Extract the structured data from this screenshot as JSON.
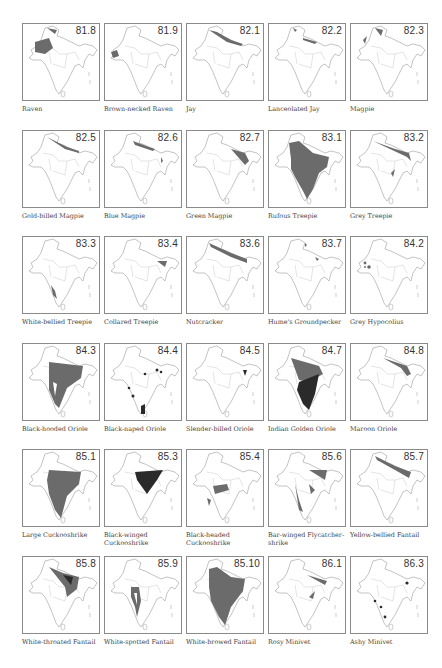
{
  "figure": {
    "shade_color": "#6b6b6b",
    "dark_shade_color": "#2a2a2a",
    "border_color": "#8a8a8a",
    "panels": [
      {
        "code": "81.8",
        "name": "Raven"
      },
      {
        "code": "81.9",
        "name": "Brown-necked Raven"
      },
      {
        "code": "82.1",
        "name": "Jay"
      },
      {
        "code": "82.2",
        "name": "Lanceolated Jay"
      },
      {
        "code": "82.3",
        "name": "Magpie"
      },
      {
        "code": "82.5",
        "name": "Gold-billed Magpie"
      },
      {
        "code": "82.6",
        "name": "Blue Magpie"
      },
      {
        "code": "82.7",
        "name": "Green Magpie"
      },
      {
        "code": "83.1",
        "name": "Rufous Treepie"
      },
      {
        "code": "83.2",
        "name": "Grey Treepie"
      },
      {
        "code": "83.3",
        "name": "White-bellied Treepie"
      },
      {
        "code": "83.4",
        "name": "Collared Treepie"
      },
      {
        "code": "83.6",
        "name": "Nutcracker"
      },
      {
        "code": "83.7",
        "name": "Hume's Groundpecker"
      },
      {
        "code": "84.2",
        "name": "Grey Hypocolius"
      },
      {
        "code": "84.3",
        "name": "Black-hooded Oriole"
      },
      {
        "code": "84.4",
        "name": "Black-naped Oriole"
      },
      {
        "code": "84.5",
        "name": "Slender-billed Oriole"
      },
      {
        "code": "84.7",
        "name": "Indian Golden Oriole"
      },
      {
        "code": "84.8",
        "name": "Maroon Oriole"
      },
      {
        "code": "85.1",
        "name": "Large Cuckooshrike"
      },
      {
        "code": "85.3",
        "name": "Black-winged Cuckooshrike"
      },
      {
        "code": "85.4",
        "name": "Black-headed Cuckooshrike"
      },
      {
        "code": "85.6",
        "name": "Bar-winged Flycatcher-shrike"
      },
      {
        "code": "85.7",
        "name": "Yellow-bellied Fantail"
      },
      {
        "code": "85.8",
        "name": "White-throated Fantail"
      },
      {
        "code": "85.9",
        "name": "White-spotted Fantail"
      },
      {
        "code": "85.10",
        "name": "White-browed Fantail"
      },
      {
        "code": "86.1",
        "name": "Rosy Minivet"
      },
      {
        "code": "86.3",
        "name": "Ashy Minivet"
      }
    ]
  }
}
